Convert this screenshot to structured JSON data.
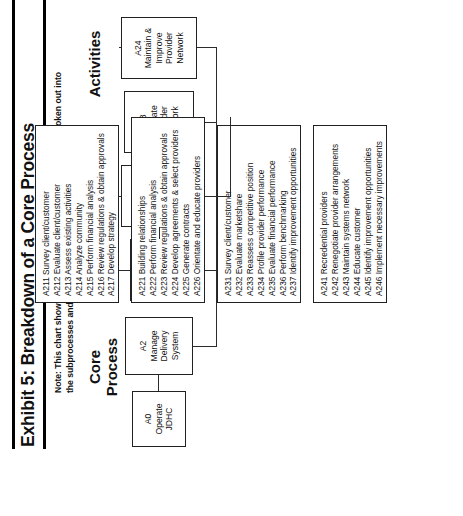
{
  "exhibit": {
    "title": "Exhibit 5: Breakdown of a Core Process",
    "note": "Note: This chart shows one core process of JDHC and how it's broken out into the subprocesses and activities."
  },
  "columns": {
    "core": "Core\nProcess",
    "subprocesses": "Subprocesses",
    "activities": "Activities"
  },
  "core_process": {
    "a0": {
      "code": "A0",
      "name": "Operate\nJDHC"
    },
    "a2": {
      "code": "A2",
      "name": "Manage\nDelivery\nSystem"
    }
  },
  "subprocesses": [
    {
      "code": "A21",
      "name": "Assess\nMarketplace"
    },
    {
      "code": "A22",
      "name": "Develop &\nImplement\nProvider\nNetwork"
    },
    {
      "code": "A23",
      "name": "Evaluate\nProvider\nNetwork"
    },
    {
      "code": "A24",
      "name": "Maintain &\nImprove\nProvider\nNetwork"
    }
  ],
  "activity_groups": [
    {
      "parent": "A21",
      "items": [
        "A211 Survey client/customer",
        "A212 Evaluate client/customer",
        "A213 Assess existing activities",
        "A214 Analyze community",
        "A215 Perform financial analysis",
        "A216 Review regulations & obtain approvals",
        "A217 Develop strategy"
      ]
    },
    {
      "parent": "A22",
      "items": [
        "A221 Building relationships",
        "A222 Perform financial analysis",
        "A223 Review regulations & obtain approvals",
        "A224 Develop agreements & select providers",
        "A225 Generate contracts",
        "A226 Orientate and educate providers"
      ]
    },
    {
      "parent": "A23",
      "items": [
        "A231 Survey client/customer",
        "A232 Evaluate marketshare",
        "A233 Reassess competitive position",
        "A234 Profile provider performance",
        "A235 Evaluate financial performance",
        "A236 Perform benchmarking",
        "A237 Identify improvement opportunities"
      ]
    },
    {
      "parent": "A24",
      "items": [
        "A241 Recredential providers",
        "A242 Renegotiate provider arrangements",
        "A243 Maintain systems network",
        "A244 Educate customer",
        "A245 Identify improvement opportunities",
        "A246 Implement necessary improvements"
      ]
    }
  ]
}
